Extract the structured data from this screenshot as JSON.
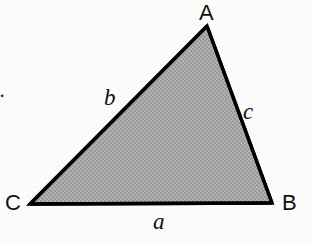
{
  "figure": {
    "number_label": "2.",
    "background_color": "#fbfbfb",
    "ink_color": "#111111",
    "fill_color": "#a8a8a8",
    "stroke_color": "#000000",
    "stroke_width_px": 3,
    "canvas": {
      "width": 312,
      "height": 246
    }
  },
  "triangle": {
    "vertices": [
      {
        "name": "A",
        "label": "A",
        "x": 207,
        "y": 26
      },
      {
        "name": "B",
        "label": "B",
        "x": 272,
        "y": 203
      },
      {
        "name": "C",
        "label": "C",
        "x": 30,
        "y": 204
      }
    ],
    "sides": [
      {
        "name": "a",
        "label": "a",
        "between": "C-B",
        "position": "bottom"
      },
      {
        "name": "b",
        "label": "b",
        "between": "C-A",
        "position": "upper-left"
      },
      {
        "name": "c",
        "label": "c",
        "between": "A-B",
        "position": "upper-right"
      }
    ]
  }
}
